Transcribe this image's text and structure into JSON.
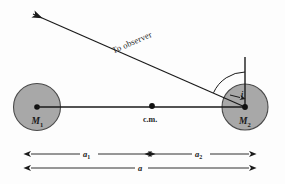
{
  "figure": {
    "background_color": "#fdfdfd",
    "line_color": "#1a1a1a",
    "body_fill_color": "#a8a8a8",
    "body_stroke_color": "#4a4a4a"
  },
  "bodies": {
    "primary": {
      "label": "M",
      "subscript": "1",
      "center_x": 37,
      "center_y": 107,
      "radius": 23.5
    },
    "secondary": {
      "label": "M",
      "subscript": "2",
      "center_x": 245,
      "center_y": 107,
      "radius": 23
    }
  },
  "center_of_mass": {
    "label": "c.m.",
    "x": 152,
    "y": 106
  },
  "observer": {
    "label": "To observer",
    "arrow_tip_x": 33,
    "arrow_tip_y": 14,
    "origin_x": 245,
    "origin_y": 107
  },
  "inclination": {
    "label": "i",
    "description": "angle between line of sight and orbital normal"
  },
  "reference_line": {
    "name": "orbital-normal",
    "top_y": 57,
    "bottom_y": 107
  },
  "dimensions": [
    {
      "name": "a1",
      "label": "a",
      "subscript": "1",
      "start_x": 31,
      "end_x": 148,
      "y": 154
    },
    {
      "name": "a2",
      "label": "a",
      "subscript": "2",
      "start_x": 152,
      "end_x": 249,
      "y": 154
    },
    {
      "name": "a",
      "label": "a",
      "subscript": "",
      "start_x": 31,
      "end_x": 249,
      "y": 168
    }
  ]
}
